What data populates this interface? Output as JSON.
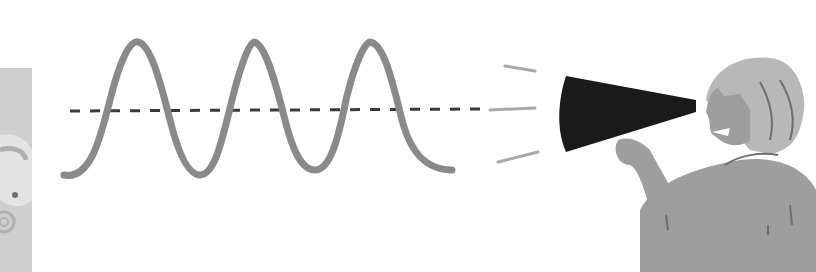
{
  "illustration": {
    "description": "Sound wave with dashed center axis emanating from a megaphone held by a shouting person",
    "colors": {
      "background": "#ffffff",
      "wave": "#8a8a8a",
      "axis_dash": "#3a3a3a",
      "megaphone": "#1a1a1a",
      "person_body": "#9e9e9e",
      "person_hair": "#b8b8b8",
      "person_lines": "#6e6e6e",
      "left_panel": "#cfcfcf",
      "left_panel_pattern": "#e6e6e6",
      "sound_lines": "#a8a8a8"
    },
    "wave": {
      "peaks": 3
    }
  }
}
